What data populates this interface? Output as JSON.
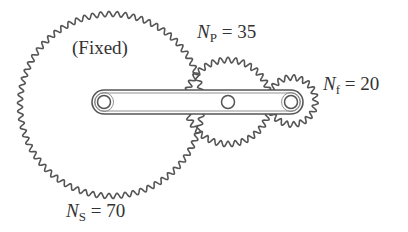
{
  "diagram": {
    "type": "epicyclic gear train",
    "stroke_color": "#555555",
    "gears": [
      {
        "id": "sun",
        "label_symbol": "N",
        "label_sub": "S",
        "eq": "= 70",
        "teeth": 70,
        "note": "(Fixed)"
      },
      {
        "id": "planet",
        "label_symbol": "N",
        "label_sub": "P",
        "eq": "= 35",
        "teeth": 35
      },
      {
        "id": "follower",
        "label_symbol": "N",
        "label_sub": "f",
        "eq": "= 20",
        "teeth": 20
      }
    ],
    "arm": {
      "pivots": 3
    }
  }
}
